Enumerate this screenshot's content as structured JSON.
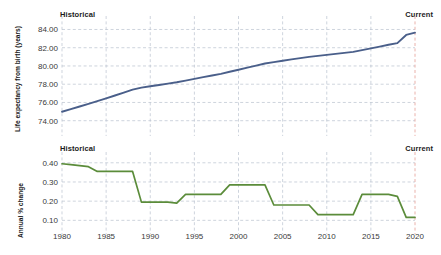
{
  "figure": {
    "width": 441,
    "height": 255,
    "background": "#ffffff"
  },
  "annotations": {
    "historical_label": "Historical",
    "current_label": "Current",
    "current_marker_year": 2020,
    "current_marker_color": "#e8a9a2",
    "grid_color": "#b9c2cf"
  },
  "chart_data": [
    {
      "id": "life-expectancy",
      "type": "line",
      "title": "",
      "xlabel": "",
      "ylabel": "Life expectancy from birth (years)",
      "color": "#4a5f8a",
      "grid": true,
      "legend": null,
      "xlim": [
        1980,
        2020
      ],
      "ylim": [
        73.2,
        84.6
      ],
      "yticks": [
        74,
        76,
        78,
        80,
        82,
        84
      ],
      "ytick_labels": [
        "74.00",
        "76.00",
        "78.00",
        "80.00",
        "82.00",
        "84.00"
      ],
      "xticks": [
        1980,
        1985,
        1990,
        1995,
        2000,
        2005,
        2010,
        2015,
        2020
      ],
      "xtick_labels": [
        "1980",
        "1985",
        "1990",
        "1995",
        "2000",
        "2005",
        "2010",
        "2015",
        "2020"
      ],
      "x": [
        1980,
        1981,
        1982,
        1983,
        1984,
        1985,
        1986,
        1987,
        1988,
        1989,
        1990,
        1991,
        1992,
        1993,
        1994,
        1995,
        1996,
        1997,
        1998,
        1999,
        2000,
        2001,
        2002,
        2003,
        2004,
        2005,
        2006,
        2007,
        2008,
        2009,
        2010,
        2011,
        2012,
        2013,
        2014,
        2015,
        2016,
        2017,
        2018,
        2019,
        2020
      ],
      "values": [
        74.98,
        75.27,
        75.56,
        75.85,
        76.15,
        76.45,
        76.76,
        77.07,
        77.4,
        77.62,
        77.77,
        77.92,
        78.07,
        78.22,
        78.4,
        78.58,
        78.77,
        78.95,
        79.14,
        79.36,
        79.58,
        79.81,
        80.04,
        80.27,
        80.42,
        80.57,
        80.72,
        80.86,
        81.0,
        81.11,
        81.22,
        81.32,
        81.43,
        81.54,
        81.73,
        81.93,
        82.12,
        82.32,
        82.5,
        83.4,
        83.65
      ]
    },
    {
      "id": "annual-percent-change",
      "type": "line",
      "title": "",
      "xlabel": "",
      "ylabel": "Annual % change",
      "color": "#5b8c3a",
      "grid": true,
      "legend": null,
      "xlim": [
        1980,
        2020
      ],
      "ylim": [
        0.06,
        0.425
      ],
      "yticks": [
        0.1,
        0.2,
        0.3,
        0.4
      ],
      "ytick_labels": [
        "0.10",
        "0.20",
        "0.30",
        "0.40"
      ],
      "xticks": [
        1980,
        1985,
        1990,
        1995,
        2000,
        2005,
        2010,
        2015,
        2020
      ],
      "xtick_labels": [
        "1980",
        "1985",
        "1990",
        "1995",
        "2000",
        "2005",
        "2010",
        "2015",
        "2020"
      ],
      "x": [
        1980,
        1981,
        1982,
        1983,
        1984,
        1985,
        1986,
        1987,
        1988,
        1989,
        1990,
        1991,
        1992,
        1993,
        1994,
        1995,
        1996,
        1997,
        1998,
        1999,
        2000,
        2001,
        2002,
        2003,
        2004,
        2005,
        2006,
        2007,
        2008,
        2009,
        2010,
        2011,
        2012,
        2013,
        2014,
        2015,
        2016,
        2017,
        2018,
        2019,
        2020
      ],
      "values": [
        0.395,
        0.39,
        0.385,
        0.38,
        0.355,
        0.355,
        0.355,
        0.355,
        0.355,
        0.195,
        0.195,
        0.195,
        0.195,
        0.19,
        0.235,
        0.235,
        0.235,
        0.235,
        0.235,
        0.285,
        0.285,
        0.285,
        0.285,
        0.285,
        0.18,
        0.18,
        0.18,
        0.18,
        0.18,
        0.13,
        0.13,
        0.13,
        0.13,
        0.13,
        0.235,
        0.235,
        0.235,
        0.235,
        0.225,
        0.115,
        0.115
      ]
    }
  ]
}
